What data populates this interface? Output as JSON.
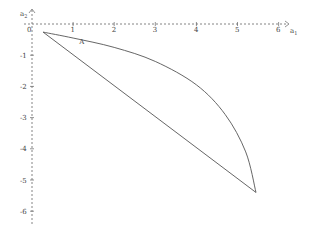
{
  "chart_data": {
    "type": "line",
    "title": "",
    "xlabel": "a_1",
    "ylabel": "a_2",
    "xlim": [
      -0.6,
      6.3
    ],
    "ylim": [
      -6.4,
      0.6
    ],
    "grid": false,
    "axes_style": "dashed",
    "x_ticks": [
      "0",
      "1",
      "2",
      "3",
      "4",
      "5",
      "6"
    ],
    "y_ticks": [
      "-1",
      "-2",
      "-3",
      "-4",
      "-5",
      "-6"
    ],
    "annotations": [
      {
        "text": "A",
        "x": 1.15,
        "y": -0.65
      }
    ],
    "series": [
      {
        "name": "curve",
        "points": [
          [
            0.27,
            -0.26
          ],
          [
            1.0,
            -0.45
          ],
          [
            2.0,
            -0.75
          ],
          [
            3.0,
            -1.2
          ],
          [
            4.0,
            -1.95
          ],
          [
            4.7,
            -2.9
          ],
          [
            5.2,
            -4.1
          ],
          [
            5.45,
            -5.4
          ]
        ]
      },
      {
        "name": "chord",
        "points": [
          [
            0.27,
            -0.26
          ],
          [
            5.45,
            -5.4
          ]
        ]
      }
    ]
  }
}
